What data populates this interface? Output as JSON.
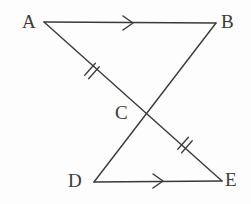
{
  "figure": {
    "background_color": "#fdfdfd",
    "stroke_color": "#3a3a3a",
    "stroke_width": 1.4,
    "width": 251,
    "height": 204
  },
  "labels": {
    "A": "A",
    "B": "B",
    "C": "C",
    "D": "D",
    "E": "E"
  },
  "points": {
    "A": {
      "x": 44,
      "y": 22
    },
    "B": {
      "x": 216,
      "y": 23
    },
    "C": {
      "x": 146,
      "y": 114
    },
    "D": {
      "x": 94,
      "y": 182
    },
    "E": {
      "x": 222,
      "y": 181
    }
  },
  "segments": [
    {
      "name": "AB",
      "from": "A",
      "to": "B",
      "marks": "single-arrow"
    },
    {
      "name": "AE",
      "from": "A",
      "to": "E",
      "marks": "double-tick-on-AC"
    },
    {
      "name": "BD",
      "from": "B",
      "to": "D",
      "marks": "none"
    },
    {
      "name": "DE",
      "from": "D",
      "to": "E",
      "marks": "single-arrow"
    }
  ],
  "marks": {
    "arrow_AB": {
      "x": 128,
      "y": 23,
      "direction": "right",
      "count": 1
    },
    "arrow_DE": {
      "x": 158,
      "y": 181,
      "direction": "right",
      "count": 1
    },
    "tick_AC": {
      "x": 92,
      "y": 71,
      "count": 2
    },
    "tick_CE": {
      "x": 185,
      "y": 145,
      "count": 2
    }
  },
  "chart_data": {
    "type": "diagram",
    "vertices": [
      "A",
      "B",
      "C",
      "D",
      "E"
    ],
    "edges": [
      {
        "edge": "A-B",
        "annotation": "arrow (parallel mark)"
      },
      {
        "edge": "A-E",
        "annotation": "passes through C; AC has double tick; CE has double tick"
      },
      {
        "edge": "B-D",
        "annotation": "passes through C"
      },
      {
        "edge": "D-E",
        "annotation": "arrow (parallel mark)"
      }
    ],
    "congruence": "AC = CE (double ticks)",
    "parallel": "AB is parallel to DE (single arrows)"
  }
}
